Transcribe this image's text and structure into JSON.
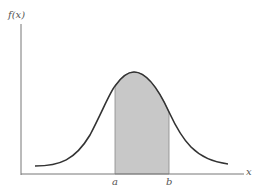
{
  "diagram": {
    "y_axis_label": "f(x)",
    "x_axis_label": "x",
    "lower_bound_label": "a",
    "upper_bound_label": "b",
    "colors": {
      "axis": "#777777",
      "curve": "#333333",
      "shaded_area": "#c8c8c8"
    }
  }
}
